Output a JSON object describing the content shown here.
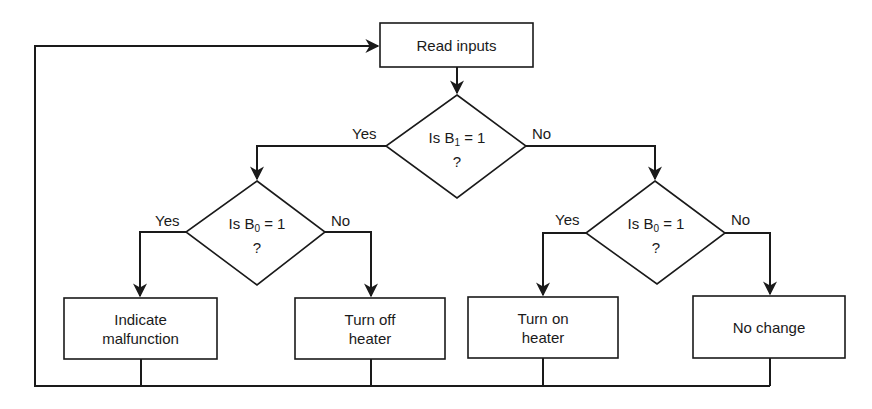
{
  "diagram": {
    "type": "flowchart",
    "nodes": {
      "start": {
        "label": "Read inputs",
        "shape": "process"
      },
      "decision_b1": {
        "prefix": "Is B",
        "subscript": "1",
        "suffix": " = 1",
        "question_mark": "?",
        "shape": "decision"
      },
      "decision_b0_left": {
        "prefix": "Is B",
        "subscript": "0",
        "suffix": " = 1",
        "question_mark": "?",
        "shape": "decision"
      },
      "decision_b0_right": {
        "prefix": "Is B",
        "subscript": "0",
        "suffix": " = 1",
        "question_mark": "?",
        "shape": "decision"
      },
      "indicate_malfunction": {
        "line1": "Indicate",
        "line2": "malfunction",
        "shape": "process"
      },
      "turn_off_heater": {
        "line1": "Turn off",
        "line2": "heater",
        "shape": "process"
      },
      "turn_on_heater": {
        "line1": "Turn on",
        "line2": "heater",
        "shape": "process"
      },
      "no_change": {
        "label": "No change",
        "shape": "process"
      }
    },
    "edges": {
      "b1_yes": "Yes",
      "b1_no": "No",
      "b0_left_yes": "Yes",
      "b0_left_no": "No",
      "b0_right_yes": "Yes",
      "b0_right_no": "No"
    },
    "colors": {
      "stroke": "#1a1a1a",
      "background": "#ffffff"
    }
  }
}
